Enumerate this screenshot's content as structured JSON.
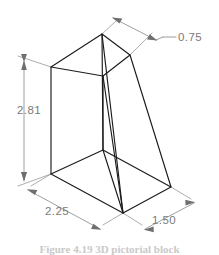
{
  "figure": {
    "type": "isometric-technical-drawing",
    "background_color": "#ffffff",
    "object_line_color": "#1b1b1b",
    "dimension_line_color": "#7d7d7d",
    "dimension_text_color": "#7a7a7a"
  },
  "dimensions": {
    "top_width": {
      "value": "0.75",
      "placement": "upper-right",
      "style": "leader"
    },
    "height": {
      "value": "2.81",
      "placement": "left",
      "style": "vertical-linear"
    },
    "base_length": {
      "value": "2.25",
      "placement": "lower-left",
      "style": "isometric-linear"
    },
    "base_depth": {
      "value": "1.50",
      "placement": "lower-right",
      "style": "isometric-linear"
    }
  },
  "caption": {
    "text": "Figure 4.19  3D pictorial block"
  }
}
